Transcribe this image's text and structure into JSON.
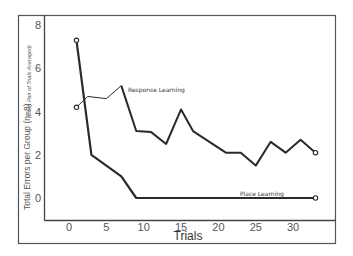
{
  "chart_data": {
    "type": "line",
    "title": "",
    "xlabel": "Trials",
    "ylabel": "Total Errors per Group (n=8)",
    "ylabel_secondary": "(Each Pair of Trials Averaged)",
    "xlim": [
      -3,
      36
    ],
    "ylim": [
      -1,
      8.5
    ],
    "x_ticks": [
      0,
      5,
      10,
      15,
      20,
      25,
      30
    ],
    "y_ticks": [
      0,
      2,
      4,
      6,
      8
    ],
    "grid": false,
    "legend": "inline annotations",
    "series": [
      {
        "name": "Response Learning",
        "line_width": "thin-to-thick",
        "x": [
          1,
          2.5,
          5,
          7,
          9,
          11,
          13,
          15,
          16.6,
          21,
          23,
          25,
          27,
          29,
          31,
          33
        ],
        "y": [
          4.2,
          4.7,
          4.6,
          5.2,
          3.1,
          3.05,
          2.5,
          4.1,
          3.1,
          2.1,
          2.1,
          1.5,
          2.6,
          2.1,
          2.7,
          2.1
        ]
      },
      {
        "name": "Place Learning",
        "line_width": "thick",
        "x": [
          1,
          3,
          7,
          9,
          33
        ],
        "y": [
          7.3,
          2.0,
          1.0,
          0,
          0
        ]
      }
    ],
    "annotations": [
      {
        "text": "Response Learning",
        "x": 8,
        "y": 5.0
      },
      {
        "text": "Place Learning",
        "x": 23,
        "y": 0.3
      }
    ]
  },
  "labels": {
    "xlabel": "Trials",
    "ylabel": "Total Errors per Group (n=8)",
    "ylabel_secondary": "(Each Pair of Trials Averaged)",
    "response": "Response Learning",
    "place": "Place Learning"
  },
  "ticks": {
    "x": [
      "0",
      "5",
      "10",
      "15",
      "20",
      "25",
      "30"
    ],
    "y": [
      "0",
      "2",
      "4",
      "6",
      "8"
    ]
  },
  "colors": {
    "line": "#2a2a2a",
    "frame": "#555555",
    "text": "#555555"
  }
}
